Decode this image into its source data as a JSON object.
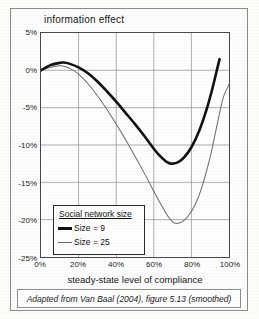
{
  "figure": {
    "caption": "Adapted from Van Baal (2004), figure 5.13 (smoothed)"
  },
  "legend": {
    "title": "Social network size",
    "entries": [
      {
        "label": "Size = 9",
        "style": "thick",
        "color": "#111111"
      },
      {
        "label": "Size = 25",
        "style": "thin",
        "color": "#6a6a6a"
      }
    ]
  },
  "chart_data": {
    "type": "line",
    "title": "information effect",
    "xlabel": "steady-state level of compliance",
    "ylabel": "",
    "xlim": [
      0,
      100
    ],
    "ylim": [
      -25,
      5
    ],
    "grid": true,
    "legend_position": "inside-lower-left",
    "xticks": [
      0,
      20,
      40,
      60,
      80,
      100
    ],
    "xticklabels": [
      "0%",
      "20%",
      "40%",
      "60%",
      "80%",
      "100%"
    ],
    "yticks": [
      5,
      0,
      -5,
      -10,
      -15,
      -20,
      -25
    ],
    "yticklabels": [
      "5%",
      "0%",
      "-5%",
      "-10%",
      "-15%",
      "-20%",
      "-25%"
    ],
    "series": [
      {
        "name": "Size = 9",
        "color": "#111111",
        "width": 2.6,
        "x": [
          0,
          5,
          10,
          12,
          15,
          20,
          25,
          30,
          35,
          40,
          45,
          50,
          55,
          60,
          63,
          66,
          68,
          70,
          73,
          76,
          80,
          84,
          88,
          91,
          94,
          95
        ],
        "y": [
          0.0,
          0.7,
          1.0,
          1.05,
          0.9,
          0.4,
          -0.4,
          -1.5,
          -2.8,
          -4.2,
          -5.7,
          -7.2,
          -8.8,
          -10.5,
          -11.4,
          -12.1,
          -12.4,
          -12.5,
          -12.3,
          -11.7,
          -10.3,
          -8.2,
          -5.3,
          -2.6,
          0.5,
          1.5
        ]
      },
      {
        "name": "Size = 25",
        "color": "#6a6a6a",
        "width": 1.0,
        "x": [
          0,
          5,
          10,
          12,
          15,
          20,
          25,
          30,
          35,
          40,
          45,
          50,
          55,
          60,
          63,
          66,
          68,
          70,
          72,
          75,
          78,
          82,
          86,
          90,
          94,
          97,
          100
        ],
        "y": [
          0.0,
          0.4,
          0.6,
          0.55,
          0.3,
          -0.5,
          -1.8,
          -3.4,
          -5.2,
          -7.2,
          -9.3,
          -11.5,
          -13.8,
          -16.2,
          -17.6,
          -18.9,
          -19.7,
          -20.3,
          -20.5,
          -20.3,
          -19.6,
          -18.0,
          -15.3,
          -11.6,
          -6.9,
          -3.6,
          -1.9
        ]
      }
    ]
  }
}
